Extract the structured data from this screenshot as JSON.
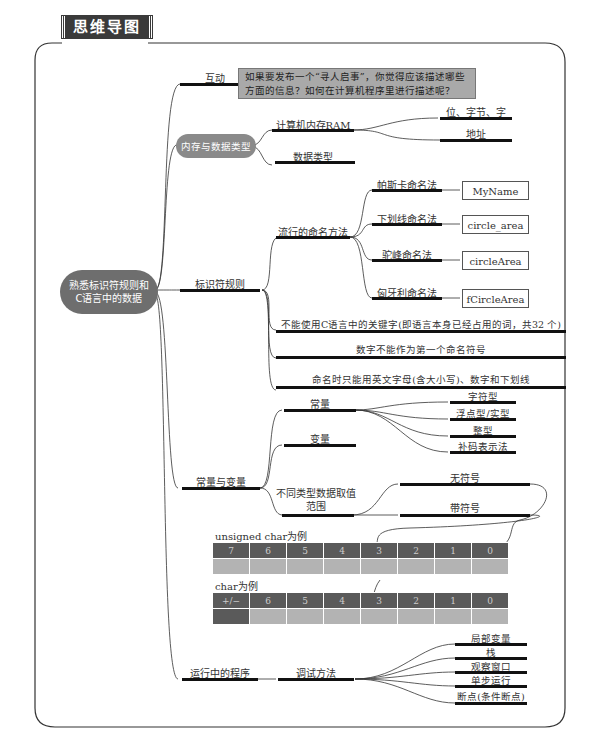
{
  "header": {
    "title": "思维导图"
  },
  "root": {
    "label_line1": "熟悉标识符规则和",
    "label_line2": "C语言中的数据"
  },
  "branches": {
    "interaction": {
      "label": "互动",
      "question": "如果要发布一个“寻人启事”，你觉得应该描述哪些方面的信息？如何在计算机程序里进行描述呢？"
    },
    "memory": {
      "label": "内存与数据类型",
      "children": [
        {
          "label": "计算机内存RAM",
          "children": [
            "位、字节、字",
            "地址"
          ]
        },
        {
          "label": "数据类型"
        }
      ]
    },
    "identifier": {
      "label": "标识符规则",
      "naming": {
        "label": "流行的命名方法",
        "methods": [
          {
            "label": "帕斯卡命名法",
            "example": "MyName"
          },
          {
            "label": "下划线命名法",
            "example": "circle_area"
          },
          {
            "label": "驼峰命名法",
            "example": "circleArea"
          },
          {
            "label": "匈牙利命名法",
            "example": "fCircleArea"
          }
        ]
      },
      "rules": [
        "不能使用C语言中的关键字(即语言本身已经占用的词，共32 个)",
        "数字不能作为第一个命名符号",
        "命名时只能用英文字母(含大小写)、数字和下划线"
      ]
    },
    "constvar": {
      "label": "常量与变量",
      "constant": {
        "label": "常量",
        "children": [
          "字符型",
          "浮点型/实型",
          "整型",
          "补码表示法"
        ]
      },
      "variable": {
        "label": "变量"
      },
      "range": {
        "label_line1": "不同类型数据取值",
        "label_line2": "范围",
        "children": [
          "无符号",
          "带符号"
        ]
      },
      "unsigned_example": {
        "caption": "unsigned char为例",
        "bits": [
          "7",
          "6",
          "5",
          "4",
          "3",
          "2",
          "1",
          "0"
        ]
      },
      "signed_example": {
        "caption": "char为例",
        "bits": [
          "+/−",
          "6",
          "5",
          "4",
          "3",
          "2",
          "1",
          "0"
        ]
      }
    },
    "runtime": {
      "label": "运行中的程序",
      "debug": {
        "label": "调试方法",
        "children": [
          "局部变量",
          "栈",
          "观察窗口",
          "单步运行",
          "断点(条件断点)"
        ]
      }
    }
  },
  "colors": {
    "cloud": "#6e6e6e",
    "question_box": "#a9a9a9",
    "bit_dark": "#5a5a5a",
    "bit_light": "#b3b3b3",
    "bar": "#111111"
  }
}
